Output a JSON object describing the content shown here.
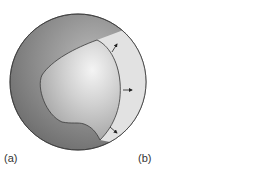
{
  "figure": {
    "panels": [
      {
        "id": "a",
        "label": "(a)"
      },
      {
        "id": "b",
        "label": "(b)"
      }
    ],
    "colors": {
      "outer_sphere_dark": "#7d7d7d",
      "inner_sphere_light": "#d6d6d6",
      "shell_band": "#e2e2e2",
      "outline": "#3a3a3a"
    }
  }
}
